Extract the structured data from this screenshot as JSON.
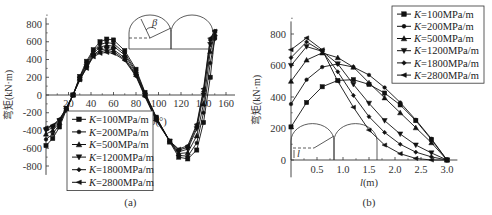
{
  "chart_data": [
    {
      "type": "line",
      "panel_label": "(a)",
      "title": "",
      "xlabel": "β(°)",
      "ylabel": "弯矩(kN·m)",
      "xlim": [
        0,
        165
      ],
      "ylim": [
        -900,
        900
      ],
      "xticks": [
        20,
        40,
        60,
        80,
        100,
        120,
        140,
        160
      ],
      "yticks": [
        -800,
        -600,
        -400,
        -200,
        0,
        200,
        400,
        600,
        800
      ],
      "grid": false,
      "legend_position": "lower-left",
      "x": [
        0,
        6,
        12,
        18,
        24,
        30,
        36,
        42,
        48,
        54,
        60,
        70,
        80,
        88,
        98,
        110,
        118,
        126,
        134,
        140,
        146,
        150
      ],
      "series": [
        {
          "name": "K=100MPa/m",
          "marker": "square",
          "values": [
            -570,
            -490,
            -360,
            -170,
            0,
            210,
            380,
            510,
            600,
            630,
            620,
            500,
            290,
            30,
            -250,
            -530,
            -700,
            -720,
            -620,
            -310,
            200,
            650
          ]
        },
        {
          "name": "K=200MPa/m",
          "marker": "circle",
          "values": [
            -500,
            -440,
            -330,
            -160,
            0,
            200,
            360,
            490,
            570,
            590,
            580,
            470,
            270,
            20,
            -250,
            -520,
            -680,
            -690,
            -540,
            -200,
            360,
            630
          ]
        },
        {
          "name": "K=500MPa/m",
          "marker": "triangle-up",
          "values": [
            -440,
            -400,
            -310,
            -160,
            0,
            190,
            340,
            470,
            540,
            560,
            550,
            450,
            250,
            10,
            -260,
            -520,
            -660,
            -650,
            -460,
            -100,
            490,
            690
          ]
        },
        {
          "name": "K=1200MPa/m",
          "marker": "triangle-down",
          "values": [
            -400,
            -370,
            -290,
            -150,
            0,
            180,
            320,
            450,
            510,
            520,
            510,
            420,
            230,
            0,
            -270,
            -520,
            -640,
            -610,
            -380,
            0,
            570,
            710
          ]
        },
        {
          "name": "K=1800MPa/m",
          "marker": "diamond",
          "values": [
            -380,
            -350,
            -280,
            -150,
            0,
            170,
            310,
            440,
            490,
            500,
            490,
            400,
            220,
            -10,
            -280,
            -520,
            -620,
            -590,
            -350,
            40,
            620,
            720
          ]
        },
        {
          "name": "K=2800MPa/m",
          "marker": "triangle-left",
          "values": [
            -370,
            -340,
            -270,
            -150,
            0,
            170,
            300,
            430,
            470,
            480,
            470,
            390,
            210,
            -20,
            -290,
            -520,
            -610,
            -570,
            -330,
            70,
            640,
            720
          ]
        }
      ]
    },
    {
      "type": "line",
      "panel_label": "(b)",
      "title": "",
      "xlabel": "l(m)",
      "ylabel": "弯矩(kN·m)",
      "xlim": [
        0,
        3.2
      ],
      "ylim": [
        -100,
        900
      ],
      "xticks": [
        0.5,
        1.0,
        1.5,
        2.0,
        2.5,
        3.0
      ],
      "yticks": [
        0,
        200,
        400,
        600,
        800
      ],
      "grid": false,
      "legend_position": "upper-right",
      "x": [
        0,
        0.3,
        0.6,
        0.9,
        1.2,
        1.5,
        1.8,
        2.1,
        2.4,
        2.7,
        3.0
      ],
      "series": [
        {
          "name": "K=100MPa/m",
          "marker": "square",
          "values": [
            210,
            365,
            465,
            505,
            510,
            480,
            425,
            350,
            250,
            130,
            0
          ]
        },
        {
          "name": "K=200MPa/m",
          "marker": "circle",
          "values": [
            355,
            510,
            590,
            610,
            590,
            540,
            460,
            365,
            255,
            135,
            0
          ]
        },
        {
          "name": "K=500MPa/m",
          "marker": "triangle-up",
          "values": [
            500,
            635,
            680,
            650,
            590,
            490,
            395,
            300,
            205,
            110,
            0
          ]
        },
        {
          "name": "K=1200MPa/m",
          "marker": "triangle-down",
          "values": [
            600,
            720,
            690,
            610,
            480,
            360,
            250,
            165,
            95,
            45,
            0
          ]
        },
        {
          "name": "K=1800MPa/m",
          "marker": "diamond",
          "values": [
            650,
            750,
            690,
            560,
            410,
            275,
            175,
            100,
            50,
            20,
            0
          ]
        },
        {
          "name": "K=2800MPa/m",
          "marker": "triangle-left",
          "values": [
            700,
            775,
            700,
            500,
            335,
            190,
            95,
            40,
            10,
            0,
            0
          ]
        }
      ]
    }
  ],
  "figure": {
    "left_caption": "(a)",
    "right_caption": "(b)",
    "left_ylabel": "弯矩(kN·m)",
    "right_ylabel": "弯矩(kN·m)",
    "left_xlabel": "β(°)",
    "right_xlabel": "l(m)",
    "inset_a_symbol": "β",
    "inset_b_symbol": "l",
    "legend_labels": [
      "K=100MPa/m",
      "K=200MPa/m",
      "K=500MPa/m",
      "K=1200MPa/m",
      "K=1800MPa/m",
      "K=2800MPa/m"
    ]
  }
}
